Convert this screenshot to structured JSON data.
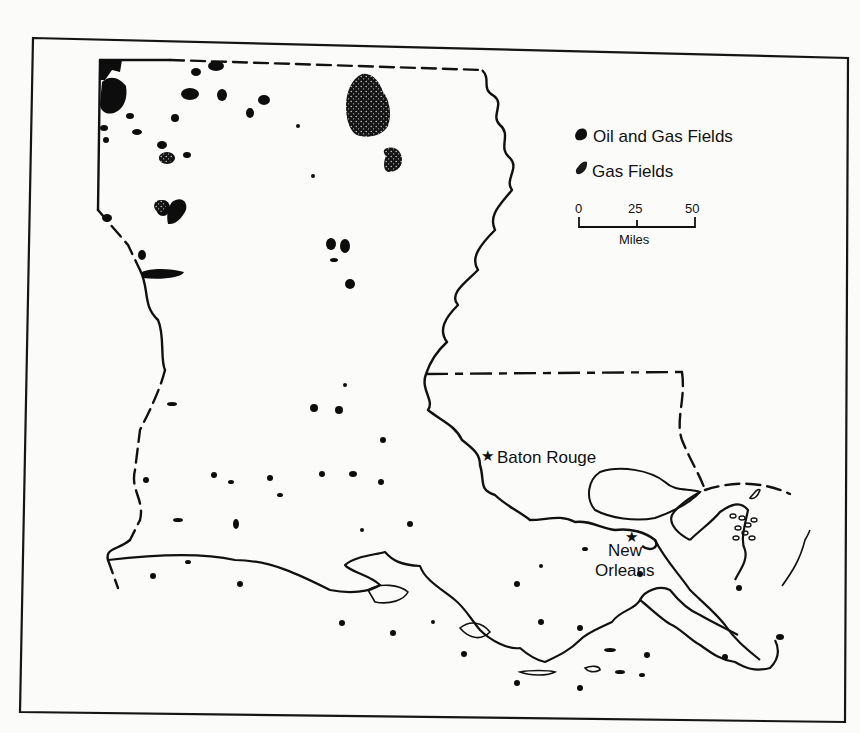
{
  "map": {
    "title": "",
    "subject": "Louisiana oil and gas fields",
    "legend": {
      "items": [
        {
          "label": "Oil and Gas Fields",
          "symbol": "solid-blob-icon",
          "x": 582,
          "y": 137
        },
        {
          "label": "Gas Fields",
          "symbol": "stippled-blob-icon",
          "x": 582,
          "y": 172
        }
      ]
    },
    "scale_bar": {
      "ticks": [
        "0",
        "25",
        "50"
      ],
      "unit": "Miles",
      "x0": 578,
      "x1": 694,
      "y": 226
    },
    "cities": [
      {
        "name": "Baton Rouge",
        "lines": [
          "Baton Rouge"
        ],
        "star_x": 488,
        "star_y": 455,
        "label_x": 498,
        "label_y": 462
      },
      {
        "name": "New Orleans",
        "lines": [
          "New",
          "Orleans"
        ],
        "star_x": 632,
        "star_y": 536,
        "label_x": 608,
        "label_y": 555
      }
    ],
    "colors": {
      "ink": "#111111",
      "paper": "#fbfbfa"
    }
  }
}
